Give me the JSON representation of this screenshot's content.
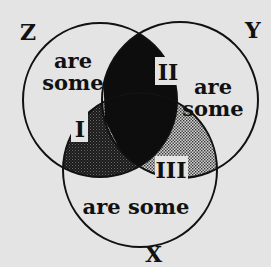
{
  "diagram": {
    "type": "venn",
    "background": "#e4e4e4",
    "colors": {
      "outline": "#111111",
      "region_II_fill": "#0d0d0d",
      "region_I_fill": "#2a2a2a",
      "region_III_fill": "#b8b8b8",
      "label_box": "#e4e4e4"
    },
    "sets": [
      {
        "id": "Z",
        "label": "Z",
        "cx": 100,
        "cy": 100,
        "r": 77
      },
      {
        "id": "Y",
        "label": "Y",
        "cx": 180,
        "cy": 100,
        "r": 78
      },
      {
        "id": "X",
        "label": "X",
        "cx": 140,
        "cy": 170,
        "r": 77
      }
    ],
    "region_texts": {
      "z_only": {
        "line1": "are",
        "line2": "some"
      },
      "y_only": {
        "line1": "are",
        "line2": "some"
      },
      "x_only": {
        "line": "are some"
      }
    },
    "regions": [
      {
        "id": "I",
        "label": "I",
        "shading": "dark stipple",
        "location": "Z ∩ X"
      },
      {
        "id": "II",
        "label": "II",
        "shading": "solid black",
        "location": "Z ∩ Y"
      },
      {
        "id": "III",
        "label": "III",
        "shading": "light stipple",
        "location": "Y ∩ X"
      }
    ]
  }
}
